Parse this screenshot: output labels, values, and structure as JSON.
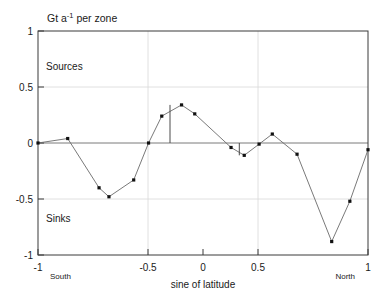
{
  "chart_data": {
    "type": "line",
    "title": "Gt a-1 per zone",
    "title_parts": {
      "lead": "Gt a",
      "sup": "-1",
      "tail": " per zone"
    },
    "xlabel": "sine of latitude",
    "ylabel": "",
    "xlim": [
      -1,
      1
    ],
    "ylim": [
      -1,
      1
    ],
    "grid": true,
    "legend": "none",
    "x_ticks": [
      -1,
      -0.5,
      0,
      0.5,
      1
    ],
    "x_tick_labels": [
      "-1",
      "-0.5",
      "0",
      "0.5",
      "1"
    ],
    "y_ticks": [
      -1,
      -0.5,
      0,
      0.5,
      1
    ],
    "y_tick_labels": [
      "-1",
      "-0.5",
      "0",
      "0.5",
      "1"
    ],
    "x": [
      -1.0,
      -0.82,
      -0.63,
      -0.57,
      -0.42,
      -0.33,
      -0.25,
      -0.13,
      -0.05,
      0.17,
      0.25,
      0.34,
      0.42,
      0.57,
      0.78,
      0.89,
      1.0
    ],
    "values": [
      0.0,
      0.04,
      -0.4,
      -0.48,
      -0.33,
      0.0,
      0.24,
      0.34,
      0.26,
      -0.04,
      -0.11,
      -0.01,
      0.08,
      -0.1,
      -0.88,
      -0.52,
      -0.06
    ],
    "series": [
      {
        "name": "zonal carbon flux",
        "x": [
          -1.0,
          -0.82,
          -0.63,
          -0.57,
          -0.42,
          -0.33,
          -0.25,
          -0.13,
          -0.05,
          0.17,
          0.25,
          0.34,
          0.42,
          0.57,
          0.78,
          0.89,
          1.0
        ],
        "values": [
          0.0,
          0.04,
          -0.4,
          -0.48,
          -0.33,
          0.0,
          0.24,
          0.34,
          0.26,
          -0.04,
          -0.11,
          -0.01,
          0.08,
          -0.1,
          -0.88,
          -0.52,
          -0.06
        ]
      }
    ],
    "error_bars": [
      {
        "x": -0.2,
        "y_top": 0.34,
        "y_bottom": 0.0
      },
      {
        "x": 0.22,
        "y_top": 0.0,
        "y_bottom": -0.11
      }
    ],
    "annotations": [
      {
        "name": "sources-label",
        "text": "Sources",
        "x": -0.75,
        "y": 0.69
      },
      {
        "name": "sinks-label",
        "text": "Sinks",
        "x": -0.75,
        "y": -0.6
      },
      {
        "name": "south-label",
        "text": "South",
        "x": -0.92,
        "y": -1.14
      },
      {
        "name": "north-label",
        "text": "North",
        "x": 0.88,
        "y": -1.14
      }
    ]
  },
  "axis": {
    "x_label": "sine of latitude",
    "south": "South",
    "north": "North"
  },
  "regions": {
    "sources": "Sources",
    "sinks": "Sinks"
  }
}
